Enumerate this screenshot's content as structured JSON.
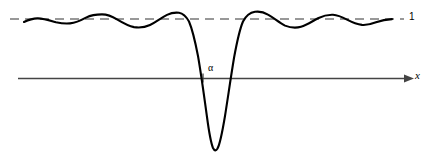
{
  "figure": {
    "title": "",
    "background_color": "#ffffff",
    "width": 430,
    "height": 162
  },
  "labels": {
    "asymptote_value": "1",
    "x_axis": "x",
    "alpha_tick": "α"
  },
  "colors": {
    "curve": "#000000",
    "axis": "#444444",
    "asymptote": "#777777",
    "text": "#000000"
  },
  "chart_data": {
    "type": "line",
    "title": "",
    "xlabel": "x",
    "ylabel": "",
    "grid": false,
    "legend": null,
    "annotations": [
      {
        "name": "asymptote-label",
        "text": "1",
        "x": 418,
        "y": 19,
        "describes": "horizontal dashed asymptote at y = 1"
      },
      {
        "name": "alpha-label",
        "text": "α",
        "x": 213,
        "y": 71,
        "describes": "tick on x axis marking the notch center x = alpha"
      },
      {
        "name": "x-axis-label",
        "text": "x",
        "x": 419,
        "y": 75,
        "describes": "axis name at the arrowhead"
      }
    ],
    "reference_lines": [
      {
        "name": "asymptote",
        "orientation": "horizontal",
        "value_label": "1",
        "style": "dashed",
        "color": "#777777",
        "x_start_px": 10,
        "x_end_px": 404,
        "y_px": 19
      },
      {
        "name": "x-axis",
        "orientation": "horizontal",
        "value_label": "0",
        "style": "solid-with-arrow",
        "color": "#444444",
        "x_start_px": 18,
        "x_end_px": 412,
        "y_px": 78
      }
    ],
    "tick_marks": [
      {
        "name": "alpha-tick",
        "axis": "x",
        "label": "α",
        "x_px": 203,
        "y_px": 78,
        "height_px": 9
      }
    ],
    "axis_px": {
      "x_axis_y_px": 78,
      "asymptote_y_px": 19,
      "x_left_px": 10,
      "x_right_px": 412
    },
    "curve_points_px": [
      [
        24,
        22
      ],
      [
        30,
        20
      ],
      [
        36,
        18.5
      ],
      [
        42,
        18.5
      ],
      [
        48,
        19.5
      ],
      [
        55,
        21.5
      ],
      [
        62,
        23
      ],
      [
        69,
        23.5
      ],
      [
        76,
        22.5
      ],
      [
        83,
        20
      ],
      [
        90,
        17
      ],
      [
        97,
        15
      ],
      [
        104,
        14.5
      ],
      [
        111,
        15.5
      ],
      [
        118,
        18
      ],
      [
        125,
        21.5
      ],
      [
        132,
        25
      ],
      [
        139,
        27
      ],
      [
        146,
        27
      ],
      [
        153,
        24.5
      ],
      [
        160,
        20
      ],
      [
        167,
        15.5
      ],
      [
        173,
        13
      ],
      [
        179,
        12.5
      ],
      [
        185,
        15
      ],
      [
        190,
        22
      ],
      [
        195,
        38
      ],
      [
        199,
        62
      ],
      [
        202,
        88
      ],
      [
        205,
        112
      ],
      [
        208,
        134
      ],
      [
        211,
        146
      ],
      [
        214,
        150
      ],
      [
        217,
        148
      ],
      [
        220,
        138
      ],
      [
        224,
        118
      ],
      [
        228,
        94
      ],
      [
        232,
        70
      ],
      [
        236,
        48
      ],
      [
        240,
        32
      ],
      [
        245,
        21
      ],
      [
        250,
        15
      ],
      [
        256,
        12
      ],
      [
        262,
        11.5
      ],
      [
        268,
        13
      ],
      [
        275,
        16.5
      ],
      [
        282,
        21
      ],
      [
        289,
        25
      ],
      [
        296,
        27.5
      ],
      [
        303,
        27
      ],
      [
        310,
        24
      ],
      [
        317,
        20
      ],
      [
        324,
        17
      ],
      [
        331,
        15
      ],
      [
        338,
        15
      ],
      [
        345,
        17
      ],
      [
        352,
        20
      ],
      [
        359,
        23
      ],
      [
        366,
        24.5
      ],
      [
        373,
        24
      ],
      [
        380,
        22
      ],
      [
        386,
        20
      ],
      [
        392,
        19
      ]
    ]
  }
}
